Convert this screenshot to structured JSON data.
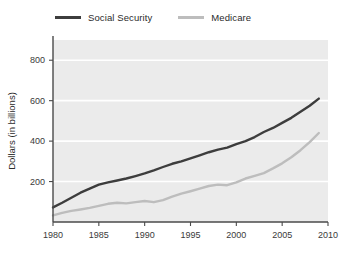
{
  "chart_data": {
    "type": "line",
    "title": "",
    "xlabel": "",
    "ylabel": "Dollars (in billions)",
    "xlim": [
      1980,
      2010
    ],
    "ylim": [
      0,
      900
    ],
    "xticks": [
      1980,
      1985,
      1990,
      1995,
      2000,
      2005,
      2010
    ],
    "yticks": [
      200,
      400,
      600,
      800
    ],
    "grid": true,
    "legend_position": "top-left",
    "x": [
      1980,
      1981,
      1982,
      1983,
      1984,
      1985,
      1986,
      1987,
      1988,
      1989,
      1990,
      1991,
      1992,
      1993,
      1994,
      1995,
      1996,
      1997,
      1998,
      1999,
      2000,
      2001,
      2002,
      2003,
      2004,
      2005,
      2006,
      2007,
      2008,
      2009
    ],
    "series": [
      {
        "name": "Social Security",
        "color": "#3d3d3d",
        "values": [
          72,
          95,
          120,
          145,
          165,
          185,
          196,
          205,
          215,
          227,
          240,
          255,
          272,
          288,
          300,
          315,
          330,
          345,
          358,
          368,
          385,
          400,
          420,
          445,
          465,
          490,
          515,
          545,
          575,
          610
        ]
      },
      {
        "name": "Medicare",
        "color": "#bdbdbd",
        "values": [
          33,
          45,
          55,
          62,
          70,
          80,
          90,
          95,
          92,
          98,
          104,
          98,
          108,
          125,
          140,
          152,
          165,
          178,
          185,
          182,
          196,
          215,
          228,
          242,
          265,
          290,
          320,
          355,
          395,
          440
        ]
      }
    ]
  },
  "legend": {
    "entries": [
      {
        "label": "Social Security",
        "color": "#3d3d3d",
        "icon": "line-swatch-dark"
      },
      {
        "label": "Medicare",
        "color": "#bdbdbd",
        "icon": "line-swatch-light"
      }
    ]
  },
  "colors": {
    "plot_background": "#ebebeb",
    "gridline": "#ffffff",
    "axis": "#4a4a4a",
    "social_security": "#3d3d3d",
    "medicare": "#bdbdbd"
  }
}
